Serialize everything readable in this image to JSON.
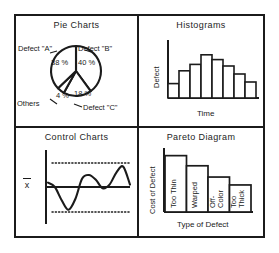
{
  "figure": {
    "frame_color": "#1b1b1b",
    "background": "#ffffff"
  },
  "quadrants": [
    {
      "key": "pie",
      "title": "Pie Charts"
    },
    {
      "key": "hist",
      "title": "Histograms"
    },
    {
      "key": "control",
      "title": "Control Charts"
    },
    {
      "key": "pareto",
      "title": "Pareto Diagram"
    }
  ],
  "pie": {
    "title": "Pie Charts",
    "labels": {
      "a": "Defect \"A\"",
      "b": "Defect \"B\"",
      "c": "Defect \"C\"",
      "others": "Others"
    },
    "percent_text": {
      "a": "38 %",
      "b": "40 %",
      "c": "18 %",
      "others": "4 %"
    }
  },
  "histogram": {
    "title": "Histograms",
    "ylabel": "Defect",
    "xlabel": "Time"
  },
  "control": {
    "title": "Control Charts",
    "center_line_label": "x",
    "center_line_label_full": "x-bar"
  },
  "pareto": {
    "title": "Pareto Diagram",
    "ylabel": "Cost of Defect",
    "xlabel": "Type of Defect",
    "bar_labels": [
      "Too Thin",
      "Warped",
      "Off- Color",
      "Too Thick"
    ],
    "bar_label_lines": [
      [
        "Too Thin"
      ],
      [
        "Warped"
      ],
      [
        "Off-",
        "Color"
      ],
      [
        "Too",
        "Thick"
      ]
    ]
  },
  "chart_data": [
    {
      "type": "pie",
      "title": "Pie Charts",
      "categories": [
        "Defect \"A\"",
        "Defect \"B\"",
        "Defect \"C\"",
        "Others"
      ],
      "values": [
        38,
        40,
        18,
        4
      ],
      "value_labels": [
        "38 %",
        "40 %",
        "18 %",
        "4 %"
      ],
      "units": "percent",
      "legend": "inline-labels",
      "grid": false
    },
    {
      "type": "bar",
      "subtype": "histogram",
      "title": "Histograms",
      "xlabel": "Time",
      "ylabel": "Defect",
      "categories": [
        "1",
        "2",
        "3",
        "4",
        "5",
        "6",
        "7",
        "8"
      ],
      "values": [
        18,
        34,
        42,
        54,
        48,
        40,
        30,
        20
      ],
      "ylim": [
        0,
        70
      ],
      "grid": false,
      "axis_ticks": false
    },
    {
      "type": "line",
      "subtype": "control-chart",
      "title": "Control Charts",
      "ylabel": "x-bar",
      "xlabel": "",
      "center_line": 0,
      "upper_control_limit": 1,
      "lower_control_limit": -1,
      "x": [
        0,
        1,
        2,
        3,
        4,
        5,
        6,
        7,
        8,
        9,
        10,
        11,
        12
      ],
      "values": [
        0.18,
        0.0,
        -0.55,
        -0.95,
        -0.5,
        0.35,
        0.5,
        0.3,
        -0.05,
        0.1,
        0.6,
        0.85,
        0.1
      ],
      "grid": false
    },
    {
      "type": "bar",
      "subtype": "pareto",
      "title": "Pareto Diagram",
      "xlabel": "Type of Defect",
      "ylabel": "Cost of Defect",
      "categories": [
        "Too Thin",
        "Warped",
        "Off-Color",
        "Too Thick"
      ],
      "values": [
        100,
        82,
        62,
        48
      ],
      "ylim": [
        0,
        110
      ],
      "grid": false,
      "axis_ticks": false
    }
  ]
}
